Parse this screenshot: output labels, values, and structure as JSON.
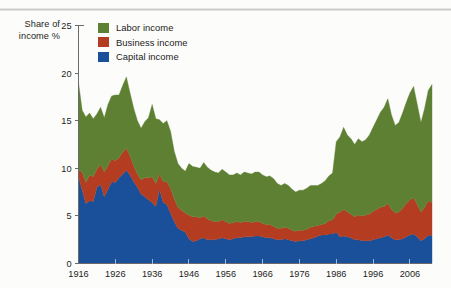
{
  "axis_caption": {
    "line1": "Share of",
    "line2": "income %"
  },
  "legend": {
    "items": [
      {
        "label": "Labor income",
        "color": "#5e8033",
        "name": "legend-labor"
      },
      {
        "label": "Business income",
        "color": "#b43c20",
        "name": "legend-business"
      },
      {
        "label": "Capital income",
        "color": "#1a5099",
        "name": "legend-capital"
      }
    ]
  },
  "colors": {
    "labor": "#5e8033",
    "business": "#b43c20",
    "capital": "#1a5099",
    "axis": "#6a6a6a",
    "text": "#1d1d1d",
    "background": "#fcfcfa"
  },
  "chart_data": {
    "type": "area",
    "stacked": true,
    "title": "",
    "subtitle": "",
    "xlabel": "",
    "ylabel": "Share of income %",
    "xlim": [
      1916,
      2012
    ],
    "ylim": [
      0,
      25
    ],
    "ytick_values": [
      0,
      5,
      10,
      15,
      20,
      25
    ],
    "ytick_labels": [
      "0",
      "5",
      "10",
      "15",
      "20",
      "25"
    ],
    "xtick_values": [
      1916,
      1926,
      1936,
      1946,
      1956,
      1966,
      1976,
      1986,
      1996,
      2006
    ],
    "xtick_labels": [
      "1916",
      "1926",
      "1936",
      "1946",
      "1956",
      "1966",
      "1976",
      "1986",
      "1996",
      "2006"
    ],
    "grid": false,
    "legend_position": "top-left-inside",
    "x": [
      1916,
      1917,
      1918,
      1919,
      1920,
      1921,
      1922,
      1923,
      1924,
      1925,
      1926,
      1927,
      1928,
      1929,
      1930,
      1931,
      1932,
      1933,
      1934,
      1935,
      1936,
      1937,
      1938,
      1939,
      1940,
      1941,
      1942,
      1943,
      1944,
      1945,
      1946,
      1947,
      1948,
      1949,
      1950,
      1951,
      1952,
      1953,
      1954,
      1955,
      1956,
      1957,
      1958,
      1959,
      1960,
      1961,
      1962,
      1963,
      1964,
      1965,
      1966,
      1967,
      1968,
      1969,
      1970,
      1971,
      1972,
      1973,
      1974,
      1975,
      1976,
      1977,
      1978,
      1979,
      1980,
      1981,
      1982,
      1983,
      1984,
      1985,
      1986,
      1987,
      1988,
      1989,
      1990,
      1991,
      1992,
      1993,
      1994,
      1995,
      1996,
      1997,
      1998,
      1999,
      2000,
      2001,
      2002,
      2003,
      2004,
      2005,
      2006,
      2007,
      2008,
      2009,
      2010,
      2011,
      2012
    ],
    "series": [
      {
        "name": "Capital income",
        "color": "#1a5099",
        "values": [
          9.2,
          7.7,
          6.3,
          6.6,
          6.5,
          8.0,
          8.3,
          7.0,
          7.8,
          8.6,
          8.5,
          9.0,
          9.4,
          9.8,
          9.3,
          8.6,
          8.0,
          7.3,
          7.0,
          6.7,
          6.4,
          6.0,
          7.8,
          6.4,
          6.2,
          5.3,
          4.4,
          3.7,
          3.5,
          3.3,
          2.6,
          2.3,
          2.4,
          2.6,
          2.7,
          2.5,
          2.5,
          2.5,
          2.6,
          2.7,
          2.6,
          2.5,
          2.6,
          2.7,
          2.7,
          2.8,
          2.8,
          2.8,
          2.9,
          2.9,
          2.8,
          2.7,
          2.7,
          2.6,
          2.5,
          2.5,
          2.6,
          2.5,
          2.4,
          2.3,
          2.4,
          2.4,
          2.5,
          2.6,
          2.7,
          2.9,
          3.0,
          3.0,
          3.1,
          3.1,
          3.3,
          2.8,
          2.9,
          2.8,
          2.7,
          2.5,
          2.5,
          2.4,
          2.4,
          2.4,
          2.5,
          2.6,
          2.7,
          2.8,
          3.0,
          2.7,
          2.5,
          2.5,
          2.6,
          2.8,
          3.0,
          3.1,
          2.8,
          2.4,
          2.6,
          3.0,
          2.9
        ]
      },
      {
        "name": "Business income",
        "color": "#b43c20",
        "values": [
          0.6,
          1.9,
          2.2,
          2.7,
          2.6,
          1.9,
          2.1,
          2.6,
          2.5,
          2.4,
          2.3,
          2.1,
          2.3,
          2.3,
          2.0,
          1.7,
          1.4,
          1.5,
          2.0,
          2.3,
          2.7,
          2.4,
          1.6,
          2.2,
          2.4,
          2.6,
          2.4,
          2.2,
          2.1,
          2.0,
          2.5,
          2.6,
          2.5,
          2.2,
          2.3,
          2.2,
          2.0,
          1.9,
          1.8,
          1.9,
          1.8,
          1.7,
          1.7,
          1.7,
          1.6,
          1.6,
          1.6,
          1.5,
          1.5,
          1.5,
          1.4,
          1.4,
          1.4,
          1.3,
          1.2,
          1.2,
          1.2,
          1.2,
          1.1,
          1.1,
          1.1,
          1.1,
          1.1,
          1.2,
          1.2,
          1.1,
          1.1,
          1.2,
          1.4,
          1.5,
          1.9,
          2.6,
          2.8,
          2.6,
          2.5,
          2.4,
          2.6,
          2.6,
          2.7,
          2.8,
          3.0,
          3.1,
          3.2,
          3.2,
          3.3,
          3.0,
          2.8,
          2.9,
          3.2,
          3.5,
          3.7,
          3.8,
          3.4,
          3.0,
          3.3,
          3.6,
          3.5
        ]
      },
      {
        "name": "Labor income",
        "color": "#5e8033",
        "values": [
          9.2,
          6.5,
          6.9,
          6.5,
          6.1,
          5.8,
          6.0,
          5.7,
          6.4,
          6.6,
          6.9,
          6.6,
          7.0,
          7.5,
          6.6,
          6.0,
          5.6,
          5.4,
          5.9,
          6.3,
          7.6,
          6.8,
          5.7,
          6.1,
          6.4,
          6.0,
          5.0,
          4.6,
          4.4,
          4.4,
          5.4,
          5.3,
          5.2,
          5.2,
          5.6,
          5.4,
          5.3,
          5.2,
          5.1,
          5.3,
          5.2,
          5.1,
          5.0,
          5.1,
          5.0,
          5.2,
          5.1,
          5.1,
          5.2,
          5.2,
          5.1,
          5.0,
          5.1,
          5.0,
          4.7,
          4.5,
          4.6,
          4.5,
          4.3,
          4.1,
          4.2,
          4.2,
          4.3,
          4.4,
          4.3,
          4.2,
          4.3,
          4.5,
          4.7,
          4.9,
          7.6,
          7.9,
          8.6,
          8.1,
          7.9,
          7.6,
          8.0,
          7.8,
          7.9,
          8.3,
          8.8,
          9.4,
          10.0,
          10.4,
          11.0,
          9.9,
          9.2,
          9.4,
          10.0,
          10.6,
          11.2,
          11.7,
          10.5,
          9.4,
          10.4,
          11.6,
          12.4
        ]
      }
    ]
  }
}
